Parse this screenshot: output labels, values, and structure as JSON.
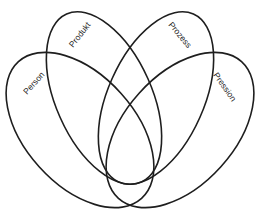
{
  "diagram": {
    "type": "four-set venn diagram",
    "sets": [
      {
        "id": "person",
        "label": "Person"
      },
      {
        "id": "produkt",
        "label": "Produkt"
      },
      {
        "id": "prozess",
        "label": "Prozess"
      },
      {
        "id": "pression",
        "label": "Pression"
      }
    ],
    "colors": {
      "stroke": "#1e1e1e",
      "background": "#ffffff"
    }
  }
}
